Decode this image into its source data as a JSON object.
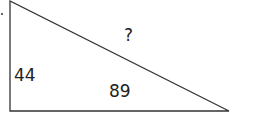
{
  "diagram": {
    "type": "right-triangle",
    "vertices": {
      "top": [
        10,
        1
      ],
      "right_angle": [
        10,
        111
      ],
      "right": [
        229,
        111
      ]
    },
    "labels": {
      "left_side": "44",
      "bottom_side": "89",
      "hypotenuse": "?"
    },
    "stroke_color": "#333333"
  }
}
